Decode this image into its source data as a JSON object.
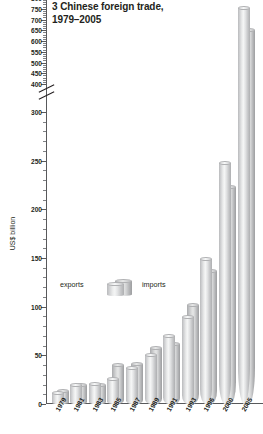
{
  "chart_data": {
    "type": "bar",
    "title": "3 Chinese foreign trade, 1979–2005",
    "title_line1": "3 Chinese foreign trade,",
    "title_line2": "1979–2005",
    "xlabel": "",
    "ylabel": "US$ billion",
    "ylim": [
      0,
      800
    ],
    "grid": false,
    "axis_break": {
      "from": 300,
      "to": 400
    },
    "legend_position": "inside-left",
    "categories": [
      "1979",
      "1981",
      "1983",
      "1985",
      "1987",
      "1989",
      "1991",
      "1993",
      "1996",
      "2000",
      "2005"
    ],
    "series": [
      {
        "name": "exports",
        "values": [
          13.7,
          22.0,
          22.2,
          27.4,
          39.4,
          52.5,
          71.8,
          91.7,
          151.0,
          249.2,
          762.0
        ]
      },
      {
        "name": "imports",
        "values": [
          15.6,
          22.0,
          21.4,
          42.3,
          43.2,
          59.1,
          63.8,
          104.0,
          138.8,
          225.1,
          660.0
        ]
      }
    ],
    "y_major_ticks": [
      0,
      50,
      100,
      150,
      200,
      250,
      300,
      400,
      450,
      500,
      550,
      600,
      650,
      700,
      750,
      800
    ],
    "y_tick_labels": [
      "0",
      "50",
      "100",
      "150",
      "200",
      "250",
      "300",
      "400",
      "450",
      "500",
      "550",
      "600",
      "650",
      "700",
      "750",
      "800"
    ],
    "colors": {
      "bar_front": "#e9eaea",
      "bar_back": "#d6d7d8",
      "axis": "#58595b",
      "text": "#231f20",
      "background": "#ffffff"
    }
  },
  "legend": {
    "exports_label": "exports",
    "imports_label": "imports"
  }
}
